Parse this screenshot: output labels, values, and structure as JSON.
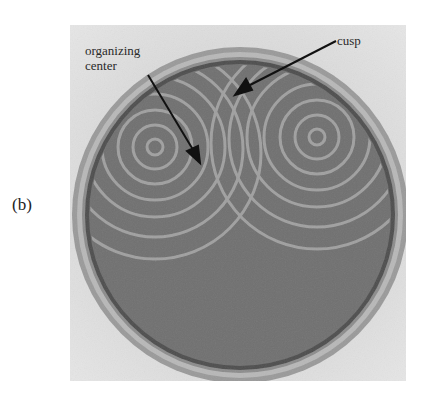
{
  "figure": {
    "panel_label": "(b)",
    "annotations": [
      {
        "id": "organizing-center",
        "text_lines": [
          "organizing",
          "center"
        ]
      },
      {
        "id": "cusp",
        "text_lines": [
          "cusp"
        ]
      }
    ],
    "colors": {
      "background": "#ffffff",
      "photo_bg": "#d6d6d6",
      "dish_medium": "#6e6e6e",
      "spiral_bands": "#a8a8a8",
      "rim": "#8a8a8a"
    }
  }
}
